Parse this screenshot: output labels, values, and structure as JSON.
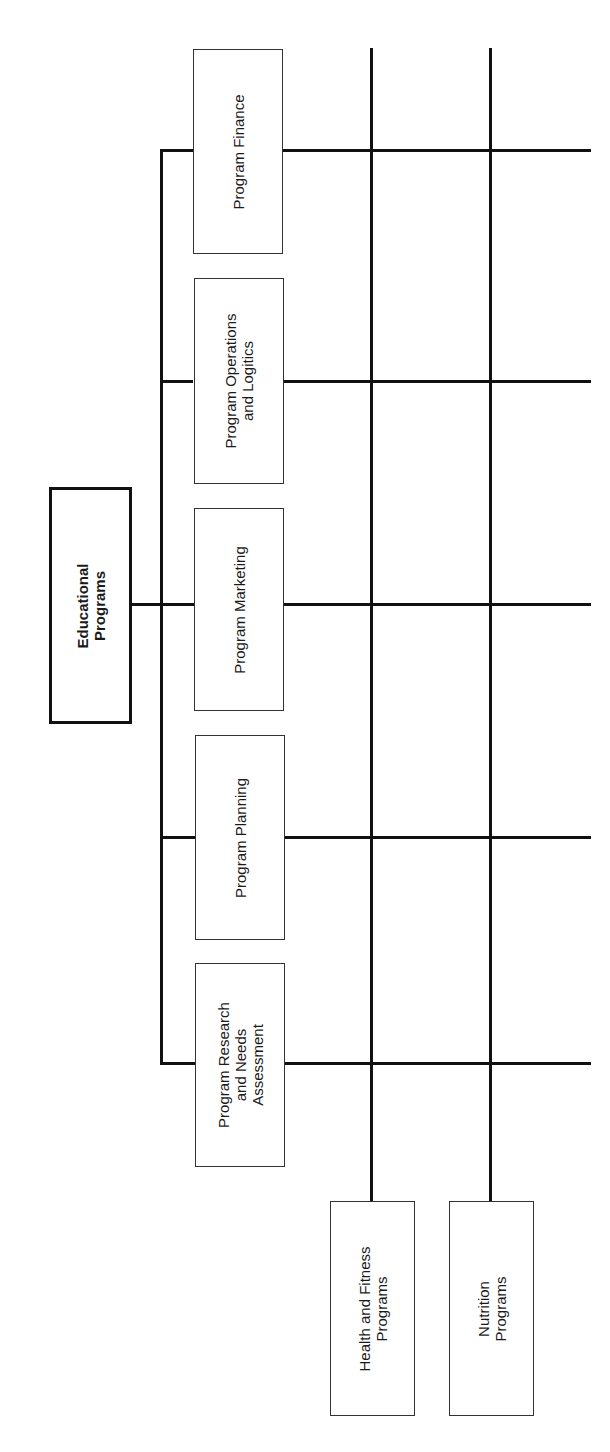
{
  "diagram": {
    "type": "organizational-matrix-chart",
    "orientation": "rotated-90-ccw",
    "root": {
      "label_lines": [
        "Educational",
        "Programs"
      ]
    },
    "functional_units": [
      {
        "id": "finance",
        "label_lines": [
          "Program Finance"
        ]
      },
      {
        "id": "operations",
        "label_lines": [
          "Program Operations",
          "and Logitics"
        ]
      },
      {
        "id": "marketing",
        "label_lines": [
          "Program Marketing"
        ]
      },
      {
        "id": "planning",
        "label_lines": [
          "Program Planning"
        ]
      },
      {
        "id": "research",
        "label_lines": [
          "Program Research",
          "and Needs",
          "Assessment"
        ]
      }
    ],
    "program_units": [
      {
        "id": "health",
        "label_lines": [
          "Health and Fitness",
          "Programs"
        ]
      },
      {
        "id": "nutrition",
        "label_lines": [
          "Nutrition",
          "Programs"
        ]
      }
    ],
    "colors": {
      "line": "#111111",
      "box_border": "#333333",
      "background": "#ffffff"
    }
  }
}
